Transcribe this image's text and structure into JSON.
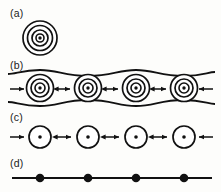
{
  "figure": {
    "width": 221,
    "height": 192,
    "background_color": "#fdfdfb",
    "ink_color": "#111111",
    "fill_color": "#ffffff"
  },
  "panels": [
    {
      "id": "a",
      "label": "(a)",
      "label_x": 10,
      "label_y": 8,
      "description": "single isolated vortex shown as concentric circles with central dot",
      "center_x": 40,
      "center_y": 38,
      "ring_radii": [
        17,
        12.5,
        8,
        4
      ],
      "ring_stroke_widths": [
        1.7,
        1.7,
        1.7,
        1.6
      ],
      "center_dot_radius": 1.7,
      "arrows": [],
      "envelope": null,
      "baseline": null
    },
    {
      "id": "b",
      "label": "(b)",
      "label_x": 10,
      "label_y": 60,
      "description": "row of four overlapping vortices with wavy upper and lower field envelope and repulsive arrows",
      "center_y": 88,
      "centers_x": [
        40,
        88,
        136,
        184
      ],
      "ring_radii": [
        13.5,
        9,
        5
      ],
      "ring_stroke_widths": [
        1.7,
        1.7,
        1.6
      ],
      "center_dot_radius": 1.7,
      "envelope": {
        "upper_y_crest": 70,
        "upper_y_trough": 76,
        "lower_y_crest": 106,
        "lower_y_trough": 100,
        "stroke_width": 1.8,
        "x_start": 8,
        "x_end": 215,
        "wave_period": 48
      },
      "arrows": [
        {
          "type": "single-right",
          "x1": 10,
          "x2": 24,
          "y": 89
        },
        {
          "type": "double",
          "x1": 58,
          "x2": 70,
          "y": 89
        },
        {
          "type": "double",
          "x1": 106,
          "x2": 118,
          "y": 89
        },
        {
          "type": "double",
          "x1": 154,
          "x2": 166,
          "y": 89
        },
        {
          "type": "single-left",
          "x1": 213,
          "x2": 199,
          "y": 89
        }
      ],
      "baseline": null
    },
    {
      "id": "c",
      "label": "(c)",
      "label_x": 10,
      "label_y": 112,
      "description": "row of four single-ring vortices with central dots and repulsive arrows",
      "center_y": 137,
      "centers_x": [
        40,
        88,
        136,
        184
      ],
      "ring_radii": [
        11
      ],
      "ring_stroke_widths": [
        1.7
      ],
      "center_dot_radius": 1.8,
      "envelope": null,
      "arrows": [
        {
          "type": "single-right",
          "x1": 10,
          "x2": 24,
          "y": 137
        },
        {
          "type": "double",
          "x1": 57,
          "x2": 71,
          "y": 137
        },
        {
          "type": "double",
          "x1": 105,
          "x2": 119,
          "y": 137
        },
        {
          "type": "double",
          "x1": 153,
          "x2": 167,
          "y": 137
        },
        {
          "type": "single-left",
          "x1": 213,
          "x2": 199,
          "y": 137
        }
      ],
      "baseline": null
    },
    {
      "id": "d",
      "label": "(d)",
      "label_x": 10,
      "label_y": 158,
      "description": "horizontal line carrying four evenly spaced filled point particles",
      "center_y": 178,
      "centers_x": [
        40,
        88,
        136,
        184
      ],
      "ring_radii": [],
      "ring_stroke_widths": [],
      "center_dot_radius": 4.3,
      "envelope": null,
      "arrows": [],
      "baseline": {
        "x_start": 12,
        "x_end": 212,
        "y": 178,
        "stroke_width": 1.8
      }
    }
  ]
}
